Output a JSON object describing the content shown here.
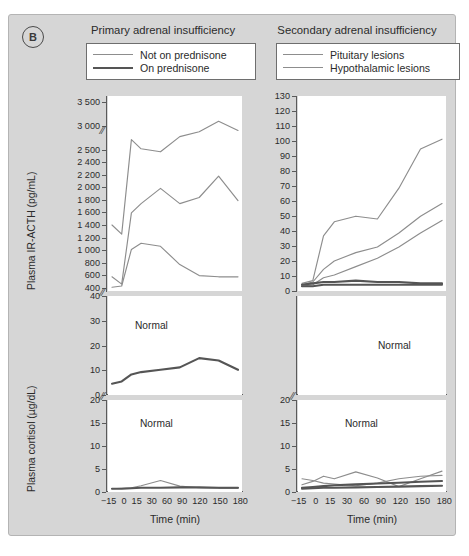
{
  "figure": {
    "panel_letter": "B",
    "background_color": "#d6d6d6",
    "plot_background": "#ffffff",
    "series_colors": {
      "light_gray": "#8d8d8d",
      "dark_gray": "#555555"
    }
  },
  "columns": {
    "left": {
      "title": "Primary adrenal insufficiency",
      "legend": [
        {
          "label": "Not on prednisone",
          "style": "thin",
          "color": "#8d8d8d"
        },
        {
          "label": "On prednisone",
          "style": "thick",
          "color": "#555555"
        }
      ]
    },
    "right": {
      "title": "Secondary adrenal insufficiency",
      "legend": [
        {
          "label": "Pituitary lesions",
          "style": "thin",
          "color": "#8d8d8d"
        },
        {
          "label": "Hypothalamic lesions",
          "style": "thin",
          "color": "#8d8d8d"
        }
      ]
    }
  },
  "axes": {
    "y_acth_label": "Plasma IR-ACTH (pg/mL)",
    "y_cortisol_label": "Plasma cortisol (µg/dL)",
    "x_label": "Time (min)",
    "x_ticks": [
      "−15",
      "0",
      "15",
      "30",
      "60",
      "90",
      "120",
      "150",
      "180"
    ],
    "left_acth_upper_ticks": [
      "3 500",
      "3 000",
      "2 500"
    ],
    "left_acth_lower_ticks": [
      "2 400",
      "2 200",
      "2 000",
      "1 800",
      "1 600",
      "1 400",
      "1 200",
      "1 000",
      "800",
      "600",
      "400"
    ],
    "left_cortisol_upper_ticks": [
      "40",
      "30",
      "20",
      "10",
      "0"
    ],
    "left_cortisol_lower_ticks": [
      "20",
      "15",
      "10",
      "5",
      "0"
    ],
    "right_acth_ticks": [
      "130",
      "120",
      "110",
      "100",
      "90",
      "80",
      "70",
      "60",
      "50",
      "40",
      "30",
      "20",
      "10",
      "0"
    ],
    "right_cortisol_lower_ticks": [
      "20",
      "15",
      "10",
      "5",
      "0"
    ],
    "break_marker": "≈"
  },
  "annotations": {
    "normal_label": "Normal"
  },
  "chart_data": {
    "type": "line",
    "xlabel": "Time (min)",
    "x": [
      -15,
      0,
      15,
      30,
      60,
      90,
      120,
      150,
      180
    ],
    "panels": [
      {
        "id": "left-acth",
        "column": "Primary adrenal insufficiency",
        "ylabel": "Plasma IR-ACTH (pg/mL)",
        "ylim": [
          400,
          3500
        ],
        "axis_break": true,
        "grid": false,
        "series": [
          {
            "name": "Not on prednisone A",
            "color": "#8d8d8d",
            "values": [
              1450,
              1300,
              2850,
              2700,
              2650,
              2900,
              2980,
              3150,
              3000
            ]
          },
          {
            "name": "Not on prednisone B",
            "color": "#8d8d8d",
            "values": [
              600,
              480,
              1650,
              1800,
              2050,
              1800,
              1900,
              2250,
              1850
            ]
          },
          {
            "name": "Not on prednisone C",
            "color": "#8d8d8d",
            "values": [
              430,
              450,
              1050,
              1150,
              1100,
              800,
              620,
              600,
              600
            ]
          }
        ]
      },
      {
        "id": "left-cortisol",
        "column": "Primary adrenal insufficiency",
        "ylabel": "Plasma cortisol (µg/dL)",
        "ylim": [
          0,
          40
        ],
        "grid": false,
        "normal_band_label": "Normal",
        "series": [
          {
            "name": "On prednisone",
            "color": "#555555",
            "values": [
              4,
              5,
              8,
              9,
              10,
              11,
              15,
              14,
              10
            ]
          }
        ]
      },
      {
        "id": "left-cortisol-low",
        "column": "Primary adrenal insufficiency",
        "ylabel": "Plasma cortisol (µg/dL)",
        "ylim": [
          0,
          20
        ],
        "grid": false,
        "normal_band_label": "Normal",
        "series": [
          {
            "name": "Not on prednisone A",
            "color": "#8d8d8d",
            "values": [
              0.3,
              0.4,
              0.5,
              1.0,
              2.2,
              0.9,
              0.5,
              0.4,
              0.4
            ]
          },
          {
            "name": "Not on prednisone B",
            "color": "#555555",
            "values": [
              0.3,
              0.3,
              0.4,
              0.5,
              0.5,
              0.6,
              0.6,
              0.5,
              0.5
            ]
          }
        ]
      },
      {
        "id": "right-acth",
        "column": "Secondary adrenal insufficiency",
        "ylabel": "Plasma IR-ACTH (pg/mL)",
        "ylim": [
          0,
          135
        ],
        "grid": false,
        "normal_band_label": "Normal",
        "series": [
          {
            "name": "Hypothalamic lesions A",
            "color": "#8d8d8d",
            "values": [
              4,
              6,
              38,
              48,
              52,
              50,
              72,
              100,
              107
            ]
          },
          {
            "name": "Hypothalamic lesions B",
            "color": "#8d8d8d",
            "values": [
              3,
              5,
              14,
              20,
              26,
              30,
              40,
              52,
              61
            ]
          },
          {
            "name": "Pituitary lesions A",
            "color": "#8d8d8d",
            "values": [
              2,
              3,
              8,
              10,
              16,
              22,
              30,
              40,
              49
            ]
          },
          {
            "name": "Pituitary lesions B",
            "color": "#555555",
            "values": [
              3,
              4,
              5,
              5,
              6,
              5,
              5,
              4,
              4
            ]
          },
          {
            "name": "Pituitary lesions C",
            "color": "#555555",
            "values": [
              2,
              2,
              3,
              3,
              3,
              3,
              3,
              3,
              3
            ]
          }
        ]
      },
      {
        "id": "right-cortisol-low",
        "column": "Secondary adrenal insufficiency",
        "ylabel": "Plasma cortisol (µg/dL)",
        "ylim": [
          0,
          20
        ],
        "grid": false,
        "normal_band_label": "Normal",
        "series": [
          {
            "name": "Series 1",
            "color": "#8d8d8d",
            "values": [
              1.2,
              2.0,
              3.2,
              2.6,
              4.2,
              2.8,
              0.8,
              2.6,
              4.4
            ]
          },
          {
            "name": "Series 2",
            "color": "#8d8d8d",
            "values": [
              2.6,
              2.2,
              1.6,
              1.4,
              1.0,
              1.6,
              2.6,
              3.2,
              3.4
            ]
          },
          {
            "name": "Series 3",
            "color": "#555555",
            "values": [
              0.5,
              0.7,
              0.9,
              1.1,
              1.3,
              1.5,
              1.7,
              1.9,
              2.1
            ]
          },
          {
            "name": "Series 4",
            "color": "#555555",
            "values": [
              0.3,
              0.4,
              0.5,
              0.5,
              0.6,
              0.7,
              0.8,
              0.9,
              1.0
            ]
          }
        ]
      }
    ]
  }
}
